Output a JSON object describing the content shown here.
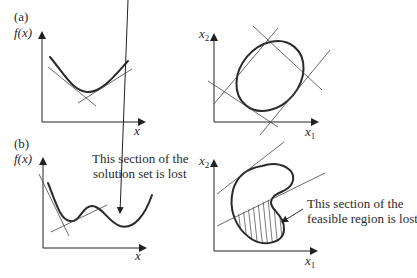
{
  "panels": {
    "a": {
      "label": "(a)",
      "left_plot": {
        "ylabel": "f(x)",
        "xlabel": "x",
        "description": "convex function with supporting tangent lines"
      },
      "right_plot": {
        "ylabel": "x",
        "ylabel_sub": "2",
        "xlabel": "x",
        "xlabel_sub": "1",
        "description": "convex feasible region (ellipse) with four tangent lines"
      }
    },
    "b": {
      "label": "(b)",
      "left_plot": {
        "ylabel": "f(x)",
        "xlabel": "x",
        "annotation_line1": "This section of the",
        "annotation_line2": "solution set is lost",
        "description": "non-convex function with local minima and tangent lines"
      },
      "right_plot": {
        "ylabel": "x",
        "ylabel_sub": "2",
        "xlabel": "x",
        "xlabel_sub": "1",
        "annotation_line1": "This section of the",
        "annotation_line2": "feasible region is lost",
        "description": "non-convex (kidney-shaped) feasible region with hatched lost section"
      }
    }
  },
  "colors": {
    "ink": "#2a2a2a",
    "background": "#ffffff"
  }
}
